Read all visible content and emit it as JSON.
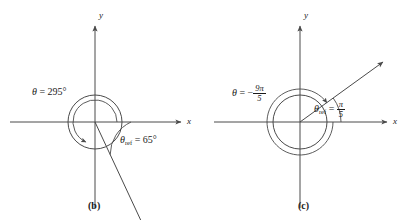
{
  "figure": {
    "width": 412,
    "height": 220,
    "background": "#ffffff",
    "stroke_color": "#4a4a4a",
    "text_color": "#1a1a1a"
  },
  "panels": [
    {
      "id": "b",
      "caption": "(b)",
      "axis_x_label": "x",
      "axis_y_label": "y",
      "origin": {
        "x": 95,
        "y": 122
      },
      "circle_radius": 27,
      "angle_label": {
        "theta": "θ",
        "equals": "=",
        "value": "295",
        "degree": "°",
        "full": "θ = 295°"
      },
      "reference_angle_label": {
        "theta": "θ",
        "subscript": "ref",
        "equals": "=",
        "value": "65",
        "degree": "°",
        "full": "θref = 65°"
      },
      "terminal_ray_degrees": 295,
      "rotation_direction": "counterclockwise"
    },
    {
      "id": "c",
      "caption": "(c)",
      "axis_x_label": "x",
      "axis_y_label": "y",
      "origin": {
        "x": 300,
        "y": 122
      },
      "circle_radius": 27,
      "angle_label": {
        "theta": "θ",
        "equals": "=",
        "minus": "−",
        "numerator": "9π",
        "denominator": "5",
        "full": "θ = −9π/5"
      },
      "reference_angle_label": {
        "theta": "θ",
        "subscript": "ref",
        "equals": "=",
        "numerator": "π",
        "denominator": "5",
        "full": "θref = π/5"
      },
      "terminal_ray_degrees": 36,
      "rotation_direction": "clockwise"
    }
  ]
}
